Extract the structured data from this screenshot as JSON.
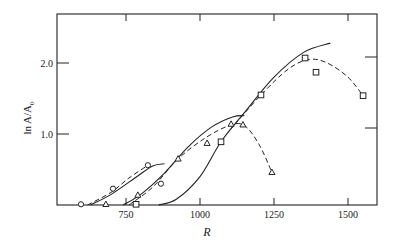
{
  "chart_data": {
    "type": "scatter",
    "title": "",
    "xlabel": "R",
    "ylabel": "ln A/A₀",
    "xlim": [
      490,
      1615
    ],
    "ylim": [
      0,
      2.7
    ],
    "grid": false,
    "legend": null,
    "x_ticks": [
      750,
      1000,
      1250,
      1500
    ],
    "x_tick_labels": [
      "750",
      "1000",
      "1250",
      "1500"
    ],
    "y_ticks": [
      1.0,
      2.0
    ],
    "y_tick_labels": [
      "1.0",
      "2.0"
    ],
    "series": [
      {
        "name": "circles",
        "marker": "circle",
        "points": [
          [
            598,
            0.01
          ],
          [
            706,
            0.23
          ],
          [
            824,
            0.56
          ],
          [
            868,
            0.3
          ]
        ],
        "fit_dashed": [
          [
            620,
            0.0
          ],
          [
            700,
            0.18
          ],
          [
            760,
            0.38
          ],
          [
            824,
            0.56
          ]
        ],
        "theory_solid": [
          [
            630,
            0.0
          ],
          [
            700,
            0.15
          ],
          [
            780,
            0.38
          ],
          [
            840,
            0.55
          ],
          [
            880,
            0.58
          ]
        ]
      },
      {
        "name": "triangles",
        "marker": "triangle",
        "points": [
          [
            682,
            0.01
          ],
          [
            790,
            0.14
          ],
          [
            926,
            0.65
          ],
          [
            1024,
            0.87
          ],
          [
            1105,
            1.14
          ],
          [
            1145,
            1.13
          ],
          [
            1243,
            0.46
          ]
        ],
        "fit_dashed": [
          [
            760,
            0.0
          ],
          [
            840,
            0.25
          ],
          [
            926,
            0.65
          ],
          [
            1020,
            0.95
          ],
          [
            1100,
            1.12
          ],
          [
            1150,
            1.12
          ],
          [
            1200,
            0.85
          ],
          [
            1243,
            0.46
          ]
        ],
        "theory_solid": [
          [
            740,
            0.0
          ],
          [
            800,
            0.15
          ],
          [
            880,
            0.45
          ],
          [
            960,
            0.82
          ],
          [
            1040,
            1.1
          ],
          [
            1110,
            1.24
          ],
          [
            1150,
            1.26
          ]
        ]
      },
      {
        "name": "squares",
        "marker": "square",
        "points": [
          [
            784,
            0.01
          ],
          [
            1071,
            0.89
          ],
          [
            1206,
            1.55
          ],
          [
            1355,
            2.07
          ],
          [
            1392,
            1.87
          ],
          [
            1551,
            1.54
          ]
        ],
        "fit_dashed": [
          [
            1100,
            1.05
          ],
          [
            1206,
            1.55
          ],
          [
            1300,
            1.92
          ],
          [
            1370,
            2.05
          ],
          [
            1430,
            2.0
          ],
          [
            1500,
            1.8
          ],
          [
            1551,
            1.54
          ]
        ],
        "theory_solid": [
          [
            860,
            0.0
          ],
          [
            920,
            0.08
          ],
          [
            1000,
            0.4
          ],
          [
            1071,
            0.89
          ],
          [
            1150,
            1.3
          ],
          [
            1250,
            1.8
          ],
          [
            1350,
            2.15
          ],
          [
            1440,
            2.28
          ]
        ]
      }
    ]
  },
  "axes": {
    "xlabel": "R",
    "ylabel_main": "ln A/A",
    "ylabel_sub": "0",
    "x_tick_labels": [
      "750",
      "1000",
      "1250",
      "1500"
    ],
    "y_tick_labels": [
      "1.0",
      "2.0"
    ]
  },
  "colors": {
    "ink": "#222222",
    "background": "#ffffff"
  }
}
